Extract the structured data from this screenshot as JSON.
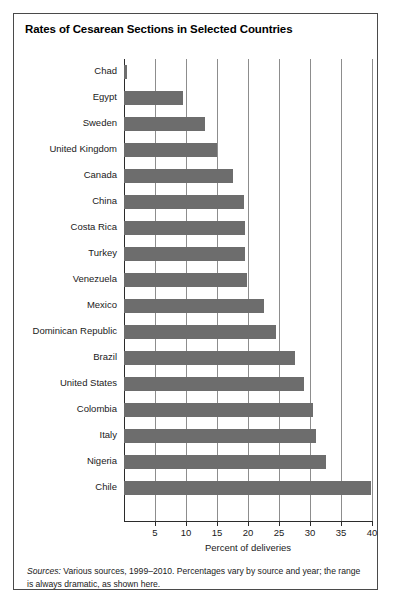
{
  "chart_data": {
    "type": "bar",
    "orientation": "horizontal",
    "title": "Rates of Cesarean Sections in Selected Countries",
    "xlabel": "Percent of deliveries",
    "ylabel": "",
    "xlim": [
      0,
      40
    ],
    "xticks": [
      5,
      10,
      15,
      20,
      25,
      30,
      35,
      40
    ],
    "grid": true,
    "legend": false,
    "bar_color": "#6d6d6d",
    "categories": [
      "Chad",
      "Egypt",
      "Sweden",
      "United Kingdom",
      "Canada",
      "China",
      "Costa Rica",
      "Turkey",
      "Venezuela",
      "Mexico",
      "Dominican Republic",
      "Brazil",
      "United States",
      "Colombia",
      "Italy",
      "Nigeria",
      "Chile"
    ],
    "values": [
      0.5,
      9.5,
      13,
      15,
      17.5,
      19.3,
      19.5,
      19.5,
      19.8,
      22.5,
      24.5,
      27.5,
      29,
      30.5,
      31,
      32.5,
      39.8
    ],
    "annotations": [
      "Sources: Various sources, 1999–2010. Percentages vary by source and year; the range is always dramatic, as shown here."
    ]
  },
  "footnote": {
    "source_label": "Sources:",
    "text": " Various sources, 1999–2010. Percentages vary by source and year; the range is always dramatic, as shown here."
  }
}
